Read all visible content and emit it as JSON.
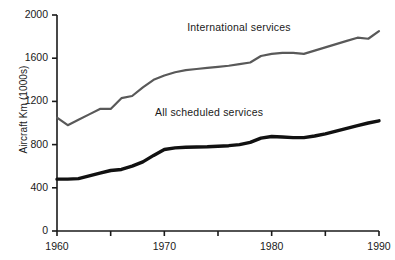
{
  "chart_data": {
    "type": "line",
    "title": "",
    "subtitle": "",
    "xlabel": "",
    "ylabel": "Aircraft Km (1000s)",
    "xlim": [
      1960,
      1990
    ],
    "ylim": [
      0,
      2000
    ],
    "xticks": [
      1960,
      1965,
      1970,
      1975,
      1980,
      1985,
      1990
    ],
    "xtick_labels": [
      "1960",
      "",
      "1970",
      "",
      "1980",
      "",
      "1990"
    ],
    "yticks": [
      0,
      400,
      800,
      1200,
      1600,
      2000
    ],
    "ytick_labels": [
      "0",
      "400",
      "800",
      "1200",
      "1600",
      "2000"
    ],
    "grid": false,
    "legend_position": "inline-annotation",
    "x": [
      1960,
      1961,
      1962,
      1963,
      1964,
      1965,
      1966,
      1967,
      1968,
      1969,
      1970,
      1971,
      1972,
      1973,
      1974,
      1975,
      1976,
      1977,
      1978,
      1979,
      1980,
      1981,
      1982,
      1983,
      1984,
      1985,
      1986,
      1987,
      1988,
      1989,
      1990
    ],
    "series": [
      {
        "name": "International services",
        "color": "#595959",
        "width": 2.2,
        "values": [
          1050,
          980,
          1030,
          1080,
          1130,
          1130,
          1230,
          1250,
          1330,
          1400,
          1440,
          1470,
          1490,
          1500,
          1510,
          1520,
          1530,
          1545,
          1560,
          1620,
          1640,
          1650,
          1650,
          1640,
          1670,
          1700,
          1730,
          1760,
          1790,
          1780,
          1850
        ]
      },
      {
        "name": "All scheduled services",
        "color": "#111111",
        "width": 3.4,
        "values": [
          480,
          480,
          485,
          510,
          535,
          560,
          570,
          600,
          640,
          700,
          755,
          770,
          775,
          778,
          780,
          785,
          790,
          800,
          820,
          860,
          875,
          870,
          865,
          865,
          880,
          900,
          925,
          950,
          975,
          1000,
          1020
        ]
      }
    ],
    "annotations": [
      {
        "name": "international-services-label",
        "text": "International services",
        "x": 1978,
        "y": 1880
      },
      {
        "name": "all-scheduled-services-label",
        "text": "All scheduled services",
        "x": 1975,
        "y": 1090
      }
    ],
    "axis_color": "#1a1a1a"
  }
}
